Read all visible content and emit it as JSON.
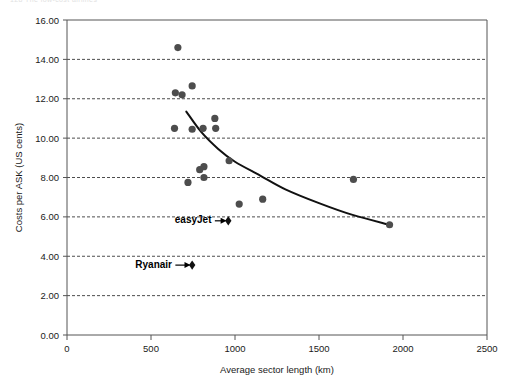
{
  "page": {
    "running_head": "128    The low-cost airlines"
  },
  "chart_data": {
    "type": "scatter",
    "title": "",
    "xlabel": "Average sector length (km)",
    "ylabel": "Costs per ASK (US cents)",
    "xlim": [
      0,
      2500
    ],
    "ylim": [
      0,
      16
    ],
    "xticks": [
      0,
      500,
      1000,
      1500,
      2000,
      2500
    ],
    "xtick_labels": [
      "0",
      "500",
      "1000",
      "1500",
      "2000",
      "2500"
    ],
    "yticks": [
      0,
      2,
      4,
      6,
      8,
      10,
      12,
      14,
      16
    ],
    "ytick_labels": [
      "0.00",
      "2.00",
      "4.00",
      "6.00",
      "8.00",
      "10.00",
      "12.00",
      "14.00",
      "16.00"
    ],
    "grid": "horizontal-dashed",
    "legend": "none",
    "series": [
      {
        "name": "Airlines",
        "marker": "circle",
        "color": "#4d4d4d",
        "points": [
          {
            "x": 660,
            "y": 14.6
          },
          {
            "x": 645,
            "y": 12.3
          },
          {
            "x": 685,
            "y": 12.2
          },
          {
            "x": 745,
            "y": 12.65
          },
          {
            "x": 640,
            "y": 10.5
          },
          {
            "x": 745,
            "y": 10.45
          },
          {
            "x": 810,
            "y": 10.5
          },
          {
            "x": 880,
            "y": 11.0
          },
          {
            "x": 885,
            "y": 10.5
          },
          {
            "x": 790,
            "y": 8.4
          },
          {
            "x": 815,
            "y": 8.55
          },
          {
            "x": 815,
            "y": 8.0
          },
          {
            "x": 720,
            "y": 7.75
          },
          {
            "x": 965,
            "y": 8.85
          },
          {
            "x": 1025,
            "y": 6.65
          },
          {
            "x": 1165,
            "y": 6.9
          },
          {
            "x": 1705,
            "y": 7.9
          },
          {
            "x": 1920,
            "y": 5.6
          }
        ]
      },
      {
        "name": "Highlighted low-cost carriers",
        "marker": "diamond",
        "color": "#111111",
        "points": [
          {
            "x": 960,
            "y": 5.8,
            "label": "easyJet"
          },
          {
            "x": 745,
            "y": 3.55,
            "label": "Ryanair"
          }
        ]
      }
    ],
    "trendline": {
      "name": "Fitted cost curve",
      "color": "#111111",
      "points": [
        {
          "x": 710,
          "y": 11.35
        },
        {
          "x": 800,
          "y": 10.3
        },
        {
          "x": 900,
          "y": 9.45
        },
        {
          "x": 1000,
          "y": 8.8
        },
        {
          "x": 1150,
          "y": 8.1
        },
        {
          "x": 1300,
          "y": 7.4
        },
        {
          "x": 1500,
          "y": 6.7
        },
        {
          "x": 1700,
          "y": 6.1
        },
        {
          "x": 1920,
          "y": 5.6
        }
      ]
    },
    "annotations": [
      {
        "name": "easyJet",
        "text": "easyJet",
        "text_x": 860,
        "text_y": 5.85,
        "arrow_from_x": 880,
        "arrow_from_y": 5.8,
        "arrow_to_x": 950,
        "arrow_to_y": 5.8
      },
      {
        "name": "Ryanair",
        "text": "Ryanair",
        "text_x": 625,
        "text_y": 3.6,
        "arrow_from_x": 645,
        "arrow_from_y": 3.55,
        "arrow_to_x": 735,
        "arrow_to_y": 3.55
      }
    ]
  }
}
